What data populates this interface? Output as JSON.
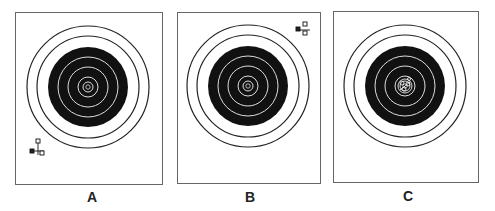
{
  "figure": {
    "panels": [
      {
        "label": "A",
        "description": "Shot group low left; sight correction indicator at lower left",
        "group_position": "lower-left"
      },
      {
        "label": "B",
        "description": "Shot group high right; sight correction indicator at upper right",
        "group_position": "upper-right"
      },
      {
        "label": "C",
        "description": "Shot group centered in bullseye",
        "group_position": "center"
      }
    ]
  },
  "colors": {
    "ink": "#111111",
    "frame": "#555555",
    "paper": "#ffffff"
  }
}
